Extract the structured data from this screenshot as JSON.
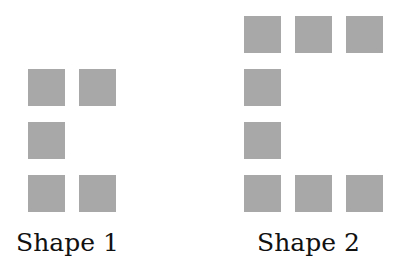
{
  "colors": {
    "square": "#a8a8a8",
    "text": "#111111"
  },
  "shapes": [
    {
      "label": "Shape 1",
      "squares": [
        {
          "x": 28,
          "y": 69
        },
        {
          "x": 79,
          "y": 69
        },
        {
          "x": 28,
          "y": 122
        },
        {
          "x": 28,
          "y": 175
        },
        {
          "x": 79,
          "y": 175
        }
      ]
    },
    {
      "label": "Shape 2",
      "squares": [
        {
          "x": 244,
          "y": 16
        },
        {
          "x": 295,
          "y": 16
        },
        {
          "x": 346,
          "y": 16
        },
        {
          "x": 244,
          "y": 69
        },
        {
          "x": 244,
          "y": 122
        },
        {
          "x": 244,
          "y": 175
        },
        {
          "x": 295,
          "y": 175
        },
        {
          "x": 346,
          "y": 175
        }
      ]
    }
  ]
}
